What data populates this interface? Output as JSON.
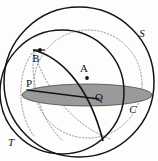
{
  "figure": {
    "background_color": "#fdfdfd",
    "stroke_color": "#141414",
    "dotted_color": "#8f8f8f",
    "shade_fill": "#9a9a9a",
    "shade_stroke": "#3a3a3a",
    "canvas": {
      "width": 158,
      "height": 161
    }
  },
  "labels": [
    {
      "id": "S",
      "text": "S",
      "x": 142,
      "y": 37,
      "style": "italic",
      "name": "label-sphere-s"
    },
    {
      "id": "T",
      "text": "T",
      "x": 11,
      "y": 146,
      "style": "italic",
      "name": "label-sphere-t"
    },
    {
      "id": "B",
      "text": "B",
      "x": 36,
      "y": 62,
      "style": "upright",
      "name": "label-point-b"
    },
    {
      "id": "A",
      "text": "A",
      "x": 84,
      "y": 72,
      "style": "upright",
      "name": "label-point-a"
    },
    {
      "id": "P",
      "text": "P",
      "x": 29,
      "y": 87,
      "style": "upright",
      "name": "label-point-p"
    },
    {
      "id": "Q",
      "text": "Q",
      "x": 99,
      "y": 101,
      "style": "upright",
      "name": "label-point-q"
    },
    {
      "id": "C",
      "text": "C",
      "x": 133,
      "y": 113,
      "style": "italic",
      "name": "label-point-c"
    }
  ],
  "points": [
    {
      "id": "A",
      "cx": 87,
      "cy": 78,
      "r": 1.9,
      "name": "point-a-dot"
    },
    {
      "id": "B",
      "cx": 39,
      "cy": 52,
      "r": 1.9,
      "name": "point-b-dot"
    }
  ],
  "circles": [
    {
      "id": "S_outer",
      "cx": 79,
      "cy": 82,
      "r": 75,
      "style": "solid",
      "name": "circle-sphere-s-outline"
    },
    {
      "id": "T_outer",
      "cx": 62,
      "cy": 92,
      "r": 62,
      "style": "solid",
      "name": "circle-sphere-t-outline"
    },
    {
      "id": "dotted_inner",
      "cx": 88,
      "cy": 84,
      "r": 54,
      "style": "dotted",
      "name": "circle-dotted-inner"
    }
  ],
  "ellipses": [
    {
      "id": "equator_disk",
      "cx": 87,
      "cy": 95,
      "rx": 65,
      "ry": 11,
      "fill": "#9a9a9a",
      "name": "shaded-equator-disk"
    }
  ],
  "arcs": [
    {
      "id": "geodesic_B_Q",
      "name": "arc-geodesic-b-q",
      "style": "solid"
    },
    {
      "id": "chord_P_Q",
      "name": "chord-p-to-q",
      "style": "solid"
    },
    {
      "id": "dotted_meridian_left",
      "name": "arc-dotted-meridian-left",
      "style": "dotted"
    },
    {
      "id": "dotted_meridian_mid",
      "name": "arc-dotted-meridian-mid",
      "style": "dotted"
    },
    {
      "id": "dotted_meridian_lower",
      "name": "arc-dotted-meridian-lower",
      "style": "dotted"
    }
  ]
}
